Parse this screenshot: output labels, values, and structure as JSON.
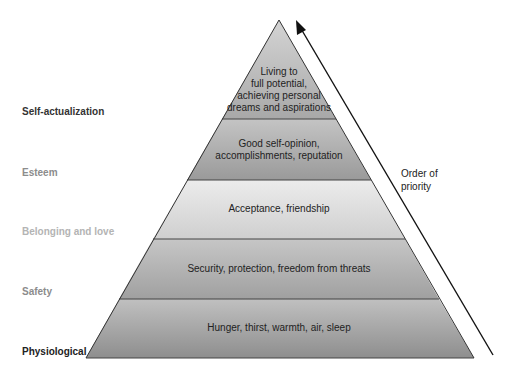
{
  "diagram": {
    "levels": [
      {
        "name": "Self-actualization",
        "description": "Living to full potential, achieving personal dreams and aspirations",
        "desc_lines": [
          "Living to",
          "full potential,",
          "achieving personal",
          "dreams and aspirations"
        ],
        "label_color": "#333333",
        "fill_top": "#d4d4d4",
        "fill_bottom": "#a8a8a8"
      },
      {
        "name": "Esteem",
        "description": "Good self-opinion, accomplishments, reputation",
        "desc_lines": [
          "Good self-opinion,",
          "accomplishments, reputation"
        ],
        "label_color": "#8c8c8c",
        "fill_top": "#c4c4c4",
        "fill_bottom": "#9a9a9a"
      },
      {
        "name": "Belonging and love",
        "description": "Acceptance, friendship",
        "desc_lines": [
          "Acceptance, friendship"
        ],
        "label_color": "#b4b4b4",
        "fill_top": "#ececec",
        "fill_bottom": "#cfcfcf"
      },
      {
        "name": "Safety",
        "description": "Security, protection, freedom from threats",
        "desc_lines": [
          "Security, protection, freedom from threats"
        ],
        "label_color": "#8c8c8c",
        "fill_top": "#c6c6c6",
        "fill_bottom": "#a0a0a0"
      },
      {
        "name": "Physiological",
        "description": "Hunger, thirst, warmth, air, sleep",
        "desc_lines": [
          "Hunger, thirst, warmth, air, sleep"
        ],
        "label_color": "#222222",
        "fill_top": "#c0c0c0",
        "fill_bottom": "#8e8e8e"
      }
    ],
    "arrow": {
      "label_line1": "Order of",
      "label_line2": "priority",
      "direction": "up"
    },
    "colors": {
      "outline": "#333333",
      "arrow": "#111111",
      "leader_line": "#555555"
    }
  }
}
